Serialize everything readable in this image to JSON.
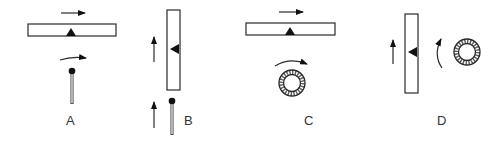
{
  "diagram": {
    "colors": {
      "stroke": "#2a2a2a",
      "fill": "#111111",
      "stem": "#bbbbbb",
      "background": "#ffffff"
    },
    "panels": [
      {
        "label": "A",
        "bar_orientation": "horizontal",
        "bar_motion": "right",
        "pointer_marker": "triangle-up",
        "rotor": "pin",
        "rotor_motion": "clockwise-arc"
      },
      {
        "label": "B",
        "bar_orientation": "vertical",
        "bar_motion": "up",
        "pointer_marker": "triangle-left",
        "rotor": "pin",
        "rotor_motion": "up"
      },
      {
        "label": "C",
        "bar_orientation": "horizontal",
        "bar_motion": "right",
        "pointer_marker": "triangle-up",
        "rotor": "gear-ring",
        "rotor_motion": "clockwise-arc"
      },
      {
        "label": "D",
        "bar_orientation": "vertical",
        "bar_motion": "up",
        "pointer_marker": "triangle-left",
        "rotor": "gear-ring",
        "rotor_motion": "counterclockwise-arc"
      }
    ]
  }
}
